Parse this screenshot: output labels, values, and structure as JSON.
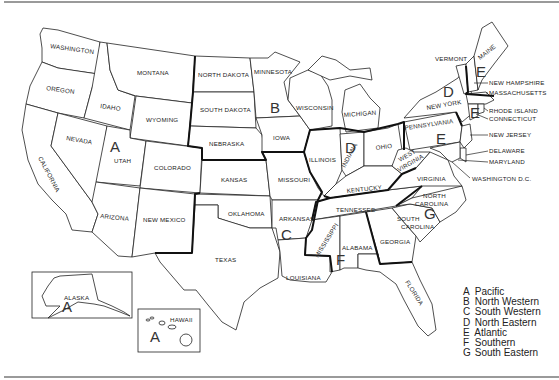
{
  "map": {
    "title": "",
    "states": {
      "washington": "WASHINGTON",
      "oregon": "OREGON",
      "california": "CALIFORNIA",
      "nevada": "NEVADA",
      "idaho": "IDAHO",
      "montana": "MONTANA",
      "wyoming": "WYOMING",
      "utah": "UTAH",
      "colorado": "COLORADO",
      "arizona": "ARIZONA",
      "new_mexico": "NEW MEXICO",
      "north_dakota": "NORTH DAKOTA",
      "south_dakota": "SOUTH DAKOTA",
      "nebraska": "NEBRASKA",
      "kansas": "KANSAS",
      "oklahoma": "OKLAHOMA",
      "texas": "TEXAS",
      "minnesota": "MINNESOTA",
      "iowa": "IOWA",
      "missouri": "MISSOURI",
      "arkansas": "ARKANSAS",
      "louisiana": "LOUISIANA",
      "wisconsin": "WISCONSIN",
      "illinois": "ILLINOIS",
      "michigan": "MICHIGAN",
      "indiana": "INDIANA",
      "ohio": "OHIO",
      "kentucky": "KENTUCKY",
      "tennessee": "TENNESSEE",
      "mississippi": "MISSISSIPPI",
      "alabama": "ALABAMA",
      "georgia": "GEORGIA",
      "florida": "FLORIDA",
      "south_carolina_1": "SOUTH",
      "south_carolina_2": "CAROLINA",
      "north_carolina_1": "NORTH",
      "north_carolina_2": "CAROLINA",
      "virginia": "VIRGINIA",
      "west_virginia_1": "WEST",
      "west_virginia_2": "VIRGINIA",
      "pennsylvania": "PENNSYLVANIA",
      "new_york": "NEW YORK",
      "vermont": "VERMONT",
      "maine": "MAINE",
      "new_hampshire": "NEW HAMPSHIRE",
      "massachusetts": "MASSACHUSETTS",
      "rhode_island": "RHODE ISLAND",
      "connecticut": "CONNECTICUT",
      "new_jersey": "NEW JERSEY",
      "delaware": "DELAWARE",
      "maryland": "MARYLAND",
      "washington_dc": "WASHINGTON D.C.",
      "alaska": "ALASKA",
      "hawaii": "HAWAII"
    },
    "region_markers": {
      "a_main": "A",
      "a_alaska": "A",
      "a_hawaii": "A",
      "b": "B",
      "c": "C",
      "d_ny": "D",
      "d_in": "D",
      "e_me": "E",
      "e_ct": "E",
      "e_pa": "E",
      "f": "F",
      "g": "G"
    }
  },
  "legend": {
    "items": [
      {
        "key": "A",
        "label": "Pacific"
      },
      {
        "key": "B",
        "label": "North Western"
      },
      {
        "key": "C",
        "label": "South Western"
      },
      {
        "key": "D",
        "label": "North Eastern"
      },
      {
        "key": "E",
        "label": "Atlantic"
      },
      {
        "key": "F",
        "label": "Southern"
      },
      {
        "key": "G",
        "label": "South Eastern"
      }
    ]
  }
}
